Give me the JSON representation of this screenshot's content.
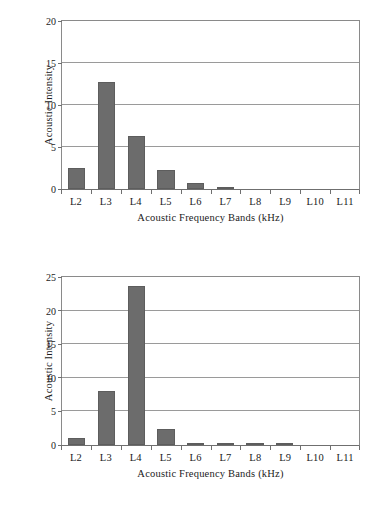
{
  "figure": {
    "background": "#ffffff",
    "bar_color": "#6c6c6c",
    "grid_color": "#9a9a9a",
    "axis_color": "#6f6f6f"
  },
  "chart_data": [
    {
      "id": "top",
      "type": "bar",
      "title": "",
      "xlabel": "Acoustic Frequency Bands (kHz)",
      "ylabel": "Acoustic Intensity",
      "categories": [
        "L2",
        "L3",
        "L4",
        "L5",
        "L6",
        "L7",
        "L8",
        "L9",
        "L10",
        "L11"
      ],
      "values": [
        2.45,
        12.75,
        6.35,
        2.25,
        0.7,
        0.15,
        0,
        0,
        0,
        0
      ],
      "ylim": [
        0,
        20
      ],
      "yticks": [
        0,
        5,
        10,
        15,
        20
      ],
      "ytick_labels": [
        "0",
        "5",
        "10",
        "15",
        "20"
      ],
      "grid": "horizontal",
      "legend": "none"
    },
    {
      "id": "bottom",
      "type": "bar",
      "title": "",
      "xlabel": "Acoustic Frequency Bands (kHz)",
      "ylabel": "Acoustic Intensity",
      "categories": [
        "L2",
        "L3",
        "L4",
        "L5",
        "L6",
        "L7",
        "L8",
        "L9",
        "L10",
        "L11"
      ],
      "values": [
        1.1,
        8.0,
        23.7,
        2.4,
        0.2,
        0.1,
        0.1,
        0.1,
        0,
        0
      ],
      "ylim": [
        0,
        25
      ],
      "yticks": [
        0,
        5,
        10,
        15,
        20,
        25
      ],
      "ytick_labels": [
        "0",
        "5",
        "10",
        "15",
        "20",
        "25"
      ],
      "grid": "horizontal",
      "legend": "none"
    }
  ]
}
